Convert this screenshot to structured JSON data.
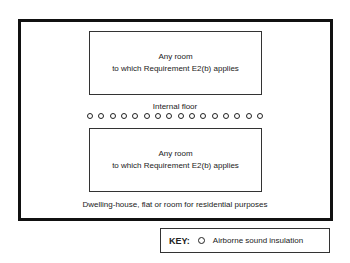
{
  "diagram": {
    "upper_room": {
      "line1": "Any room",
      "line2": "to which Requirement E2(b) applies"
    },
    "floor_label": "Internal floor",
    "insulation_symbols_count": 16,
    "lower_room": {
      "line1": "Any room",
      "line2": "to which Requirement E2(b) applies"
    },
    "enclosure_caption": "Dwelling-house, flat or room for residential purposes",
    "key": {
      "title": "KEY:",
      "symbol": "circle-icon",
      "label": "Airborne sound insulation"
    }
  }
}
